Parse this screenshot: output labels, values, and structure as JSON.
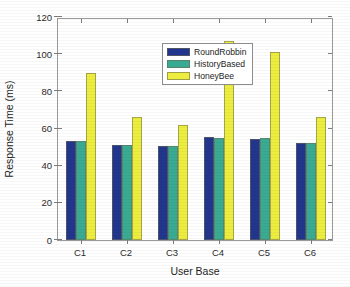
{
  "chart_data": {
    "type": "bar",
    "title": "",
    "subtitle": "",
    "xlabel": "User Base",
    "ylabel": "Response Time (ms)",
    "categories": [
      "C1",
      "C2",
      "C3",
      "C4",
      "C5",
      "C6"
    ],
    "series": [
      {
        "name": "RoundRobbin",
        "color": "#23368d",
        "values": [
          53.5,
          51.0,
          50.5,
          55.5,
          54.5,
          52.0
        ]
      },
      {
        "name": "HistoryBased",
        "color": "#3aab93",
        "values": [
          53.5,
          51.0,
          50.5,
          55.0,
          55.0,
          52.0
        ]
      },
      {
        "name": "HoneyBee",
        "color": "#eced3e",
        "values": [
          90.0,
          66.0,
          62.0,
          107.0,
          101.0,
          66.0
        ]
      }
    ],
    "ylim": [
      0,
      120
    ],
    "yticks": [
      0,
      20,
      40,
      60,
      80,
      100,
      120
    ],
    "ytick_labels": [
      "0",
      "20",
      "40",
      "60",
      "80",
      "100",
      "120"
    ],
    "grid": false,
    "legend_position": "top-center-left",
    "legend_entries": [
      "RoundRobbin",
      "HistoryBased",
      "HoneyBee"
    ],
    "annotations": []
  },
  "axes": {
    "y_title": "Response Time (ms)",
    "x_title": "User Base"
  }
}
